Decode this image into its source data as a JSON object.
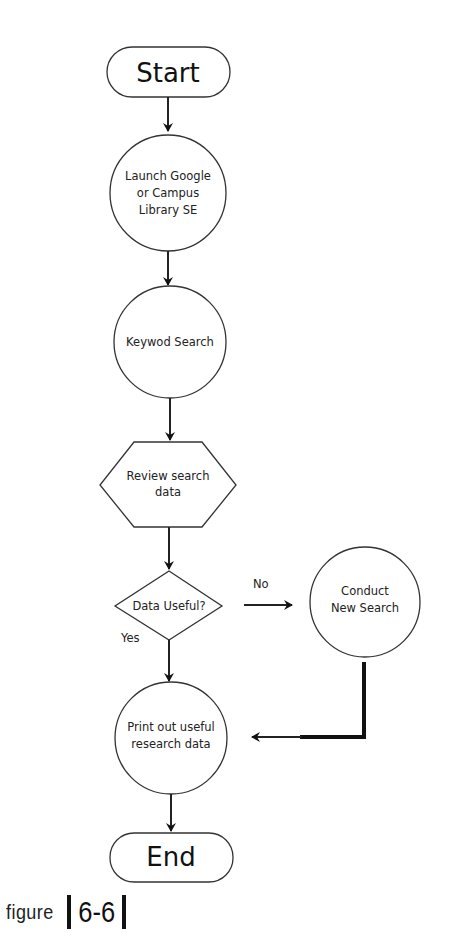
{
  "diagram": {
    "type": "flowchart",
    "nodes": {
      "start": {
        "shape": "terminator",
        "label": "Start"
      },
      "launch": {
        "shape": "circle",
        "lines": [
          "Launch Google",
          "or Campus",
          "Library SE"
        ]
      },
      "keyword": {
        "shape": "circle",
        "label": "Keywod Search"
      },
      "review": {
        "shape": "hexagon",
        "lines": [
          "Review search",
          "data"
        ]
      },
      "decision": {
        "shape": "diamond",
        "label": "Data Useful?"
      },
      "newsearch": {
        "shape": "circle",
        "lines": [
          "Conduct",
          "New Search"
        ]
      },
      "print": {
        "shape": "circle",
        "lines": [
          "Print out useful",
          "research data"
        ]
      },
      "end": {
        "shape": "terminator",
        "label": "End"
      }
    },
    "edges": {
      "no_label": "No",
      "yes_label": "Yes"
    }
  },
  "caption": {
    "word": "figure",
    "number": "6-6"
  }
}
